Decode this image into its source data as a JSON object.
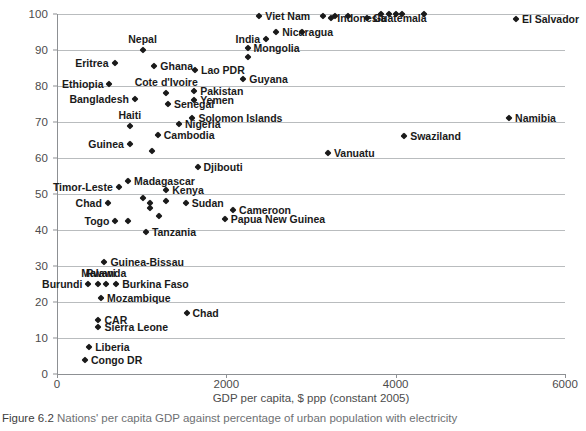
{
  "figure": {
    "number": "Figure 6.2",
    "caption": "Nations' per capita GDP against percentage of urban population with electricity"
  },
  "colors": {
    "marker": "#1a1a1a",
    "gridline": "#b9bcbe",
    "axis": "#8d9093",
    "tick_text": "#4c4c4c",
    "caption_text": "#6e7073",
    "background": "#ffffff"
  },
  "chart_data": {
    "type": "scatter",
    "title": "",
    "xlabel": "GDP per capita, $ ppp (constant 2005)",
    "ylabel": "% of the urban population with electricity",
    "xlim": [
      0,
      6000
    ],
    "ylim": [
      0,
      100
    ],
    "xticks": [
      0,
      2000,
      4000,
      6000
    ],
    "yticks": [
      0,
      10,
      20,
      30,
      40,
      50,
      60,
      70,
      80,
      90,
      100
    ],
    "grid": "horizontal",
    "legend": "none",
    "points": [
      {
        "label": "Congo DR",
        "x": 330,
        "y": 4,
        "pos": "r"
      },
      {
        "label": "Liberia",
        "x": 380,
        "y": 7.5,
        "pos": "r"
      },
      {
        "label": "Sierra Leone",
        "x": 490,
        "y": 13,
        "pos": "r"
      },
      {
        "label": "CAR",
        "x": 490,
        "y": 15,
        "pos": "r"
      },
      {
        "label": "Chad",
        "x": 1530,
        "y": 17,
        "pos": "r"
      },
      {
        "label": "Mozambique",
        "x": 520,
        "y": 21,
        "pos": "r"
      },
      {
        "label": "Burundi",
        "x": 370,
        "y": 25,
        "pos": "l"
      },
      {
        "label": "Malawi",
        "x": 490,
        "y": 25,
        "pos": "c"
      },
      {
        "label": "Rwanda",
        "x": 580,
        "y": 25,
        "pos": "c"
      },
      {
        "label": "Burkina Faso",
        "x": 700,
        "y": 25,
        "pos": "r"
      },
      {
        "label": "Guinea-Bissau",
        "x": 560,
        "y": 31,
        "pos": "r"
      },
      {
        "label": "Tanzania",
        "x": 1050,
        "y": 39.5,
        "pos": "r"
      },
      {
        "label": "Togo",
        "x": 690,
        "y": 42.5,
        "pos": "l"
      },
      {
        "label": "",
        "x": 840,
        "y": 42.5,
        "pos": "r"
      },
      {
        "label": "Papua New Guinea",
        "x": 1980,
        "y": 43,
        "pos": "r"
      },
      {
        "label": "",
        "x": 1200,
        "y": 44,
        "pos": "r"
      },
      {
        "label": "Cameroon",
        "x": 2080,
        "y": 45.5,
        "pos": "r"
      },
      {
        "label": "",
        "x": 1100,
        "y": 46,
        "pos": "r"
      },
      {
        "label": "",
        "x": 1100,
        "y": 47.5,
        "pos": "r"
      },
      {
        "label": "Chad",
        "x": 600,
        "y": 47.5,
        "pos": "l"
      },
      {
        "label": "Sudan",
        "x": 1520,
        "y": 47.5,
        "pos": "r"
      },
      {
        "label": "",
        "x": 1290,
        "y": 48,
        "pos": "r"
      },
      {
        "label": "",
        "x": 1010,
        "y": 49,
        "pos": "r"
      },
      {
        "label": "Kenya",
        "x": 1290,
        "y": 51,
        "pos": "r"
      },
      {
        "label": "Timor-Leste",
        "x": 730,
        "y": 52,
        "pos": "l"
      },
      {
        "label": "Madagascar",
        "x": 840,
        "y": 53.5,
        "pos": "r"
      },
      {
        "label": "Djibouti",
        "x": 1660,
        "y": 57.5,
        "pos": "r"
      },
      {
        "label": "Vanuatu",
        "x": 3200,
        "y": 61.5,
        "pos": "r"
      },
      {
        "label": "",
        "x": 1120,
        "y": 62,
        "pos": "r"
      },
      {
        "label": "Guinea",
        "x": 860,
        "y": 64,
        "pos": "l"
      },
      {
        "label": "Swaziland",
        "x": 4100,
        "y": 66,
        "pos": "r"
      },
      {
        "label": "Cambodia",
        "x": 1190,
        "y": 66.5,
        "pos": "r"
      },
      {
        "label": "Haiti",
        "x": 860,
        "y": 69,
        "pos": "c"
      },
      {
        "label": "Nigeria",
        "x": 1440,
        "y": 69.5,
        "pos": "r"
      },
      {
        "label": "Namibia",
        "x": 5340,
        "y": 71,
        "pos": "r"
      },
      {
        "label": "Solomon Islands",
        "x": 1600,
        "y": 71,
        "pos": "r"
      },
      {
        "label": "Senegal",
        "x": 1310,
        "y": 75,
        "pos": "r"
      },
      {
        "label": "Yemen",
        "x": 1620,
        "y": 76,
        "pos": "r"
      },
      {
        "label": "Bangladesh",
        "x": 920,
        "y": 76.5,
        "pos": "l"
      },
      {
        "label": "Pakistan",
        "x": 1620,
        "y": 78.5,
        "pos": "r"
      },
      {
        "label": "Cote d'Ivoire",
        "x": 1290,
        "y": 78,
        "pos": "c"
      },
      {
        "label": "Ethiopia",
        "x": 620,
        "y": 80.5,
        "pos": "l"
      },
      {
        "label": "Guyana",
        "x": 2200,
        "y": 82,
        "pos": "r"
      },
      {
        "label": "Lao PDR",
        "x": 1630,
        "y": 84.5,
        "pos": "r"
      },
      {
        "label": "Ghana",
        "x": 1150,
        "y": 85.5,
        "pos": "r"
      },
      {
        "label": "Eritrea",
        "x": 680,
        "y": 86.5,
        "pos": "l"
      },
      {
        "label": "",
        "x": 2250,
        "y": 88,
        "pos": "r"
      },
      {
        "label": "Nepal",
        "x": 1010,
        "y": 90,
        "pos": "c"
      },
      {
        "label": "Mongolia",
        "x": 2250,
        "y": 90.5,
        "pos": "r"
      },
      {
        "label": "India",
        "x": 2470,
        "y": 93,
        "pos": "l"
      },
      {
        "label": "Nicaragua",
        "x": 2590,
        "y": 95,
        "pos": "r"
      },
      {
        "label": "",
        "x": 2890,
        "y": 95,
        "pos": "r"
      },
      {
        "label": "Viet Nam",
        "x": 2390,
        "y": 99.5,
        "pos": "r"
      },
      {
        "label": "",
        "x": 3140,
        "y": 99.5,
        "pos": "r"
      },
      {
        "label": "Indonesia",
        "x": 3240,
        "y": 99,
        "pos": "r"
      },
      {
        "label": "",
        "x": 3280,
        "y": 99.5,
        "pos": "r"
      },
      {
        "label": "",
        "x": 3440,
        "y": 99.5,
        "pos": "r"
      },
      {
        "label": "Guatemala",
        "x": 3660,
        "y": 99,
        "pos": "r"
      },
      {
        "label": "",
        "x": 3830,
        "y": 100,
        "pos": "r"
      },
      {
        "label": "",
        "x": 3920,
        "y": 100,
        "pos": "r"
      },
      {
        "label": "",
        "x": 4000,
        "y": 100,
        "pos": "r"
      },
      {
        "label": "",
        "x": 4080,
        "y": 100,
        "pos": "r"
      },
      {
        "label": "",
        "x": 4330,
        "y": 100,
        "pos": "r"
      },
      {
        "label": "El Salvador",
        "x": 5420,
        "y": 98.5,
        "pos": "r"
      }
    ]
  }
}
